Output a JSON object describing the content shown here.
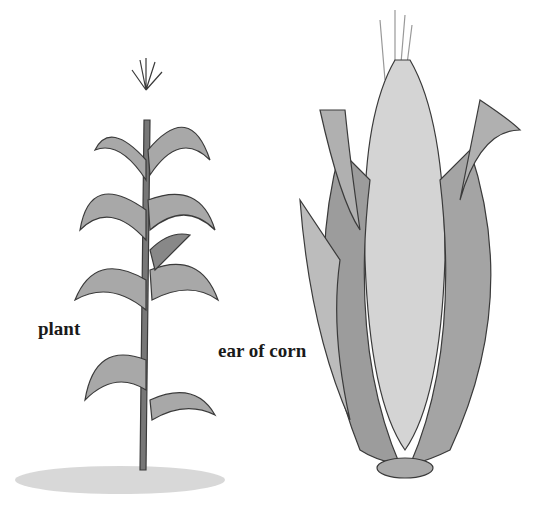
{
  "labels": {
    "plant": "plant",
    "ear": "ear of corn"
  },
  "colors": {
    "ink": "#2a2a2a",
    "leaf": "#9a9a9a",
    "kernel": "#cfcfcf",
    "ground": "#b8b8b8"
  }
}
